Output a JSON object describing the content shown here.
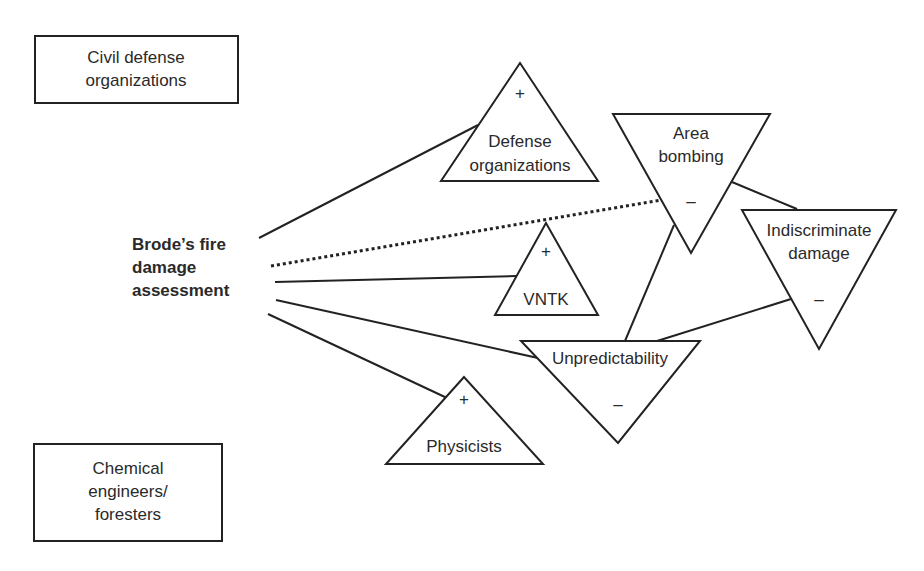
{
  "diagram": {
    "central_actor": {
      "lines": [
        "Brode’s fire",
        "damage",
        "assessment"
      ]
    },
    "boxes": [
      {
        "id": "civil-defense",
        "lines": [
          "Civil defense",
          "organizations"
        ]
      },
      {
        "id": "chemical-engineers",
        "lines": [
          "Chemical",
          "engineers/",
          "foresters"
        ]
      }
    ],
    "nodes": [
      {
        "id": "defense-organizations",
        "shape": "triangle-up",
        "sign": "+",
        "lines": [
          "Defense",
          "organizations"
        ]
      },
      {
        "id": "vntk",
        "shape": "triangle-up",
        "sign": "+",
        "lines": [
          "VNTK"
        ]
      },
      {
        "id": "physicists",
        "shape": "triangle-up",
        "sign": "+",
        "lines": [
          "Physicists"
        ]
      },
      {
        "id": "area-bombing",
        "shape": "triangle-down",
        "sign": "–",
        "lines": [
          "Area",
          "bombing"
        ]
      },
      {
        "id": "indiscriminate-damage",
        "shape": "triangle-down",
        "sign": "–",
        "lines": [
          "Indiscriminate",
          "damage"
        ]
      },
      {
        "id": "unpredictability",
        "shape": "triangle-down",
        "sign": "–",
        "lines": [
          "Unpredictability"
        ]
      }
    ],
    "edges": [
      {
        "from": "central",
        "to": "defense-organizations",
        "style": "solid"
      },
      {
        "from": "central",
        "to": "area-bombing",
        "style": "dotted"
      },
      {
        "from": "central",
        "to": "vntk",
        "style": "solid"
      },
      {
        "from": "central",
        "to": "unpredictability",
        "style": "solid"
      },
      {
        "from": "central",
        "to": "physicists",
        "style": "solid"
      },
      {
        "from": "area-bombing",
        "to": "indiscriminate-damage",
        "style": "solid"
      },
      {
        "from": "area-bombing",
        "to": "unpredictability",
        "style": "solid"
      },
      {
        "from": "indiscriminate-damage",
        "to": "unpredictability",
        "style": "solid"
      }
    ],
    "colors": {
      "stroke": "#222222",
      "background": "#ffffff"
    }
  }
}
